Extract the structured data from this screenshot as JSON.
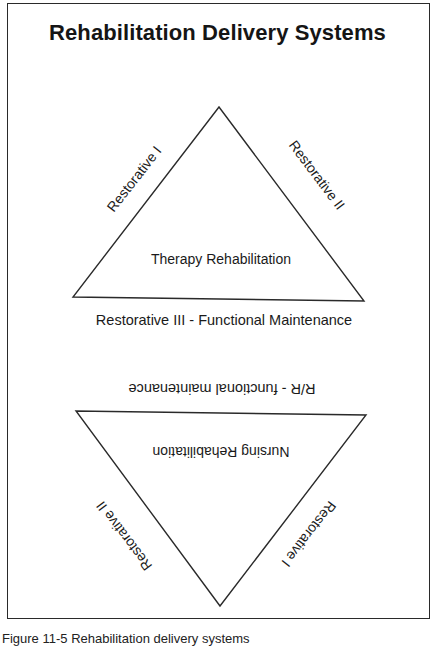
{
  "title": "Rehabilitation Delivery Systems",
  "upper_triangle": {
    "left_side_label": "Restorative I",
    "right_side_label": "Restorative II",
    "center_label": "Therapy Rehabilitation",
    "base_label": "Restorative III - Functional Maintenance"
  },
  "lower_triangle_rotated_180": {
    "base_label": "R/R - functional maintenance",
    "center_label": "Nursing Rehabilitation",
    "left_side_label": "Restorative I",
    "right_side_label": "Restorative II"
  },
  "caption": "Figure 11-5 Rehabilitation delivery systems",
  "colors": {
    "line": "#2a2a2a",
    "text": "#1a1a1a",
    "background": "#ffffff"
  }
}
